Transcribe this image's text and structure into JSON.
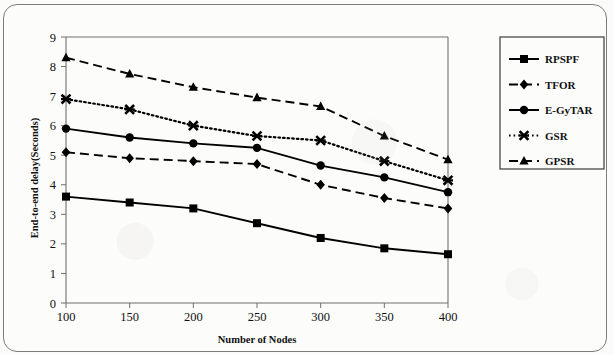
{
  "chart_data": {
    "type": "line",
    "title": "",
    "xlabel": "Number of Nodes",
    "ylabel": "End-to-end delay(Seconds)",
    "categories": [
      100,
      150,
      200,
      250,
      300,
      350,
      400
    ],
    "x": [
      100,
      150,
      200,
      250,
      300,
      350,
      400
    ],
    "xticklabels": [
      "100",
      "150",
      "200",
      "250",
      "300",
      "350",
      "400"
    ],
    "yticks": [
      0,
      1,
      2,
      3,
      4,
      5,
      6,
      7,
      8,
      9
    ],
    "yticklabels": [
      "0",
      "1",
      "2",
      "3",
      "4",
      "5",
      "6",
      "7",
      "8",
      "9"
    ],
    "xlim": [
      100,
      400
    ],
    "ylim": [
      0,
      9
    ],
    "grid": false,
    "legend_position": "upper right (outside plot)",
    "series": [
      {
        "name": "RPSPF",
        "values": [
          3.6,
          3.4,
          3.2,
          2.7,
          2.2,
          1.85,
          1.65
        ],
        "line_style": "solid",
        "marker": "square",
        "color": "#000000"
      },
      {
        "name": "TFOR",
        "values": [
          5.1,
          4.9,
          4.8,
          4.7,
          4.0,
          3.55,
          3.2
        ],
        "line_style": "dashed",
        "marker": "diamond",
        "color": "#000000"
      },
      {
        "name": "E-GyTAR",
        "values": [
          5.9,
          5.6,
          5.4,
          5.25,
          4.65,
          4.25,
          3.75
        ],
        "line_style": "solid",
        "marker": "circle",
        "color": "#000000"
      },
      {
        "name": "GSR",
        "values": [
          6.9,
          6.55,
          6.0,
          5.65,
          5.5,
          4.8,
          4.15
        ],
        "line_style": "dotted",
        "marker": "x",
        "color": "#000000"
      },
      {
        "name": "GPSR",
        "values": [
          8.3,
          7.75,
          7.3,
          6.95,
          6.65,
          5.65,
          4.85
        ],
        "line_style": "dashed",
        "marker": "triangle",
        "color": "#000000"
      }
    ]
  },
  "legend": {
    "entries": [
      "RPSPF",
      "TFOR",
      "E-GyTAR",
      "GSR",
      "GPSR"
    ]
  },
  "axis": {
    "x_title": "Number of Nodes",
    "y_title": "End-to-end delay(Seconds)"
  },
  "colors": {
    "ink": "#000000",
    "axis": "#6f6f6f",
    "frame": "#7d7d7d",
    "page": "#fbfbf9"
  }
}
